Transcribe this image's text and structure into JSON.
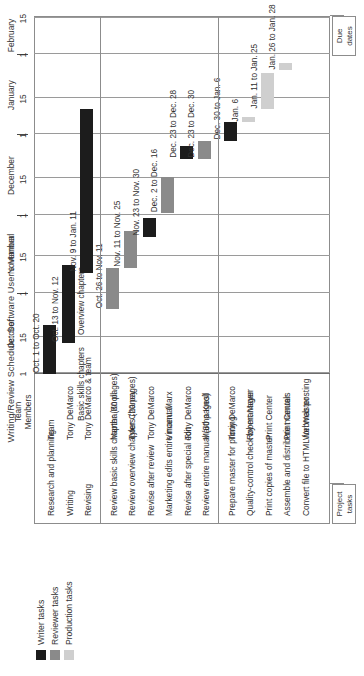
{
  "title": "Writing/Review Schedule: Software User's Manual",
  "legend": {
    "items": [
      {
        "label": "Writer tasks",
        "color": "#1c1c1c",
        "key": "writer"
      },
      {
        "label": "Reviewer tasks",
        "color": "#8a8a8a",
        "key": "reviewer"
      },
      {
        "label": "Production tasks",
        "color": "#cfcfcf",
        "key": "production"
      }
    ]
  },
  "callouts": {
    "due_dates": "Due dates",
    "project_tasks": "Project tasks"
  },
  "columns": {
    "task": "",
    "team_members": "Team\nMembers"
  },
  "axis": {
    "months": [
      "October",
      "November",
      "December",
      "January",
      "February"
    ],
    "ticks": [
      "1",
      "15",
      "1",
      "15",
      "1",
      "15",
      "1",
      "15",
      "1",
      "15"
    ]
  },
  "chart_data": {
    "type": "bar",
    "title": "Writing/Review Schedule: Software User's Manual",
    "xlabel": "",
    "ylabel": "",
    "grid": true,
    "legend_position": "left",
    "axis_start": "October 1",
    "axis_end": "February 15",
    "categories": [
      "Research and planning",
      "Writing",
      "Revising",
      "Review basic skills chapter (30 pages)",
      "Review overview chapters (20 pages)",
      "Revise after review",
      "Marketing edits entire manual",
      "Revise after special edit",
      "Review entire manual (50 pages)",
      "Prepare master for printing",
      "Quality-control check by manager",
      "Print copies of master",
      "Assemble and distribute manuals",
      "Convert file to HTML for Web posting"
    ],
    "rows": [
      {
        "task": "Research and planning",
        "members": "Team",
        "type": "writer",
        "label": "Oct. 1 to Oct. 20",
        "start": "Oct. 1",
        "end": "Oct. 20",
        "start_day": 0,
        "end_day": 19,
        "group": 1
      },
      {
        "task": "Writing",
        "members": "Tony DeMarco",
        "type": "writer",
        "label": "Oct. 13 to Nov. 12",
        "sublabels": [
          "Basic skills chapters",
          "Overview chapters"
        ],
        "start": "Oct. 13",
        "end": "Nov. 12",
        "start_day": 12,
        "end_day": 42,
        "group": 1
      },
      {
        "task": "Revising",
        "members": "Tony DeMarco & team",
        "type": "writer",
        "label": "Nov. 9 to Jan. 11",
        "start": "Nov. 9",
        "end": "Jan. 11",
        "start_day": 39,
        "end_day": 102,
        "group": 1
      },
      {
        "task": "Review basic skills chapter (30 pages)",
        "members": "Martha Knoll",
        "type": "reviewer",
        "label": "Oct. 26 to Nov. 11",
        "start": "Oct. 26",
        "end": "Nov. 11",
        "start_day": 25,
        "end_day": 41,
        "group": 2
      },
      {
        "task": "Review overview chapters (20 pages)",
        "members": "Tyler Chaney",
        "type": "reviewer",
        "label": "Nov. 11 to Nov. 25",
        "start": "Nov. 11",
        "end": "Nov. 25",
        "start_day": 41,
        "end_day": 55,
        "group": 2
      },
      {
        "task": "Revise after review",
        "members": "Tony DeMarco",
        "type": "writer",
        "label": "Nov. 23 to Nov. 30",
        "start": "Nov. 23",
        "end": "Nov. 30",
        "start_day": 53,
        "end_day": 60,
        "group": 2
      },
      {
        "task": "Marketing edits entire manual",
        "members": "Vincent Marx",
        "type": "reviewer",
        "label": "Dec. 2 to Dec. 16",
        "start": "Dec. 2",
        "end": "Dec. 16",
        "start_day": 62,
        "end_day": 76,
        "group": 2
      },
      {
        "task": "Revise after special edit",
        "members": "Tony DeMarco",
        "type": "writer",
        "label": "Dec. 23 to Dec. 28",
        "start": "Dec. 23",
        "end": "Dec. 28",
        "start_day": 83,
        "end_day": 88,
        "group": 2
      },
      {
        "task": "Review entire manual (50 pages)",
        "members": "Martha Knoll",
        "type": "reviewer",
        "label": "Dec. 23 to Dec. 30",
        "start": "Dec. 23",
        "end": "Dec. 30",
        "start_day": 83,
        "end_day": 90,
        "group": 2
      },
      {
        "task": "Prepare master for printing",
        "members": "Tony DeMarco",
        "type": "writer",
        "label": "Dec. 30 to Jan. 6",
        "start": "Dec. 30",
        "end": "Jan. 6",
        "start_day": 90,
        "end_day": 97,
        "group": 3
      },
      {
        "task": "Quality-control check by manager",
        "members": "Robert Mayer",
        "type": "production",
        "label": "Jan. 6",
        "start": "Jan. 6",
        "end": "Jan. 6",
        "start_day": 97,
        "end_day": 99,
        "group": 3
      },
      {
        "task": "Print copies of master",
        "members": "Print Center",
        "type": "production",
        "label": "Jan. 11 to Jan. 25",
        "start": "Jan. 11",
        "end": "Jan. 25",
        "start_day": 102,
        "end_day": 116,
        "group": 3
      },
      {
        "task": "Assemble and distribute manuals",
        "members": "Print Center",
        "type": "production",
        "label": "Jan. 26 to Jan. 28",
        "start": "Jan. 26",
        "end": "Jan. 28",
        "start_day": 117,
        "end_day": 120,
        "group": 3
      },
      {
        "task": "Convert file to HTML for Web posting",
        "members": "Webmaster",
        "type": "production",
        "label": "",
        "start": "",
        "end": "",
        "start_day": null,
        "end_day": null,
        "group": 3
      }
    ]
  }
}
